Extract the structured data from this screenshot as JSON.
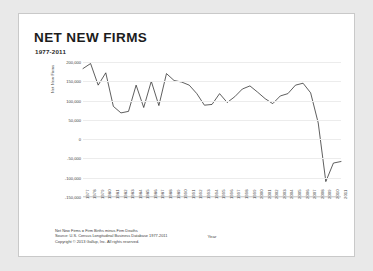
{
  "slide": {
    "title": "NET NEW FIRMS",
    "subtitle": "1977-2011",
    "notes": [
      "Net New Firms = Firm Births minus Firm Deaths",
      "Source: U.S. Census Longitudinal Business Database 1977-2011",
      "Copyright © 2013 Gallup, Inc. All rights reserved."
    ]
  },
  "chart_data": {
    "type": "line",
    "title": "NET NEW FIRMS",
    "subtitle": "1977-2011",
    "xlabel": "Year",
    "ylabel": "Net New Firms",
    "ylim": [
      -150000,
      200000
    ],
    "ytick_values": [
      200000,
      150000,
      100000,
      50000,
      0,
      -50000,
      -100000,
      -150000
    ],
    "ytick_labels": [
      "200,000",
      "150,000",
      "100,000",
      "50,000",
      "0",
      "-50,000",
      "-100,000",
      "-150,000"
    ],
    "grid": true,
    "legend": "none",
    "line_color": "#1a1a1a",
    "categories": [
      "1977",
      "1978",
      "1979",
      "1980",
      "1981",
      "1982",
      "1983",
      "1984",
      "1985",
      "1986",
      "1987",
      "1988",
      "1989",
      "1990",
      "1991",
      "1992",
      "1993",
      "1994",
      "1995",
      "1996",
      "1997",
      "1998",
      "1999",
      "2000",
      "2001",
      "2002",
      "2003",
      "2004",
      "2005",
      "2006",
      "2007",
      "2008",
      "2009",
      "2010",
      "2011"
    ],
    "values": [
      183000,
      196000,
      140000,
      172000,
      85000,
      68000,
      72000,
      140000,
      82000,
      150000,
      87000,
      170000,
      152000,
      148000,
      140000,
      118000,
      88000,
      90000,
      118000,
      95000,
      110000,
      130000,
      138000,
      122000,
      105000,
      92000,
      112000,
      118000,
      140000,
      145000,
      120000,
      42000,
      -110000,
      -62000,
      -58000
    ]
  }
}
